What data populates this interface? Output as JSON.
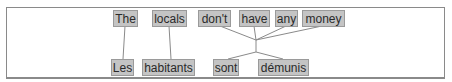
{
  "diagram": {
    "type": "word-alignment",
    "source_tokens": [
      {
        "text": "The",
        "x": 113,
        "w": 25
      },
      {
        "text": "locals",
        "x": 152,
        "w": 35
      },
      {
        "text": "don't",
        "x": 198,
        "w": 33
      },
      {
        "text": "have",
        "x": 239,
        "w": 31
      },
      {
        "text": "any",
        "x": 275,
        "w": 23
      },
      {
        "text": "money",
        "x": 302,
        "w": 43
      }
    ],
    "target_tokens": [
      {
        "text": "Les",
        "x": 111,
        "w": 23
      },
      {
        "text": "habitants",
        "x": 142,
        "w": 53
      },
      {
        "text": "sont",
        "x": 213,
        "w": 26
      },
      {
        "text": "démunis",
        "x": 258,
        "w": 51
      }
    ],
    "alignments": [
      {
        "source": [
          "The"
        ],
        "target": [
          "Les"
        ]
      },
      {
        "source": [
          "locals"
        ],
        "target": [
          "habitants"
        ]
      },
      {
        "source": [
          "don't",
          "have",
          "any",
          "money"
        ],
        "target": [
          "sont",
          "démunis"
        ]
      }
    ],
    "colors": {
      "box_fill": "#c4c4c4",
      "box_border": "#9a9a9a",
      "line": "#8a8a8a",
      "frame": "#8a8a8a"
    }
  }
}
